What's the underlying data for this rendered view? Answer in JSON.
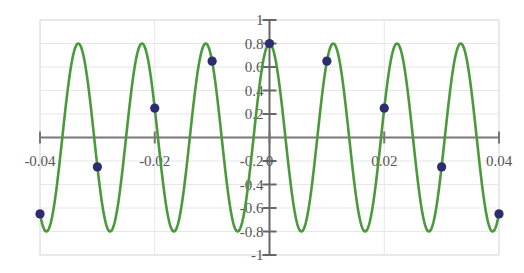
{
  "chart_data": {
    "type": "line",
    "title": "",
    "xlabel": "",
    "ylabel": "",
    "xlim": [
      -0.04,
      0.04
    ],
    "ylim": [
      -1,
      1
    ],
    "grid": true,
    "legend": "none",
    "x_ticks": [
      -0.04,
      -0.02,
      0,
      0.02,
      0.04
    ],
    "x_tick_labels": [
      "-0.04",
      "-0.02",
      "0",
      "0.02",
      "0.04"
    ],
    "y_ticks": [
      -1,
      -0.8,
      -0.6,
      -0.4,
      -0.2,
      0.2,
      0.4,
      0.6,
      0.8,
      1
    ],
    "y_tick_labels": [
      "-1",
      "-0.8",
      "-0.6",
      "-0.4",
      "-0.2",
      "0.2",
      "0.4",
      "0.6",
      "0.8",
      "1"
    ],
    "series": [
      {
        "name": "continuous signal",
        "kind": "line",
        "color": "#4a9a3c",
        "function": "0.8*cos(2*pi*90*t)",
        "amplitude": 0.8,
        "frequency_hz": 90
      },
      {
        "name": "samples",
        "kind": "scatter",
        "color": "#2b2d6e",
        "x": [
          -0.04,
          -0.03,
          -0.02,
          -0.01,
          0,
          0.01,
          0.02,
          0.03,
          0.04
        ],
        "values": [
          -0.65,
          -0.25,
          0.25,
          0.65,
          0.8,
          0.65,
          0.25,
          -0.25,
          -0.65
        ]
      }
    ]
  }
}
